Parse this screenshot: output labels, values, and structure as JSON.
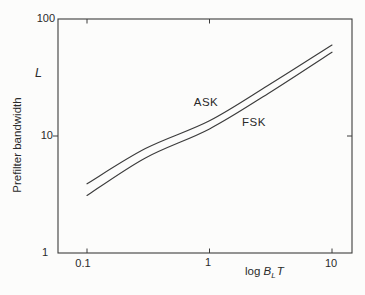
{
  "figure": {
    "background": "#fcfcfb",
    "line_color": "#3c3c3c",
    "text_color": "#2a2a2a"
  },
  "labels": {
    "y_axis_title": "Prefilter bandwidth",
    "y_axis_symbol": "L",
    "x_axis_log": "log ",
    "x_axis_B": "B",
    "x_axis_sub": "L",
    "x_axis_T": "T",
    "series_ask": "ASK",
    "series_fsk": "FSK",
    "y_tick_100": "100",
    "y_tick_10": "10",
    "y_tick_1": "1",
    "x_tick_01": "0.1",
    "x_tick_1": "1",
    "x_tick_10": "10"
  },
  "chart_data": {
    "type": "line",
    "title": "",
    "xlabel": "log B_L T",
    "ylabel": "Prefilter bandwidth (L)",
    "x_scale": "log",
    "y_scale": "log",
    "xlim": [
      0.06,
      14.5
    ],
    "ylim": [
      1,
      100
    ],
    "x_ticks": [
      0.1,
      1,
      10
    ],
    "y_ticks": [
      1,
      10,
      100
    ],
    "grid": false,
    "legend": "inline-labels",
    "axes_ticks": {
      "bottom": [
        0.1,
        1,
        10
      ],
      "top": [
        0.1,
        1
      ],
      "left": [
        10
      ],
      "right": [
        10
      ]
    },
    "series": [
      {
        "name": "ASK",
        "points": [
          [
            0.1,
            3.9
          ],
          [
            0.3,
            7.8
          ],
          [
            1,
            13.5
          ],
          [
            3,
            27
          ],
          [
            10,
            60
          ]
        ]
      },
      {
        "name": "FSK",
        "points": [
          [
            0.1,
            3.1
          ],
          [
            0.3,
            6.5
          ],
          [
            1,
            11.5
          ],
          [
            3,
            23
          ],
          [
            10,
            52
          ]
        ]
      }
    ]
  }
}
